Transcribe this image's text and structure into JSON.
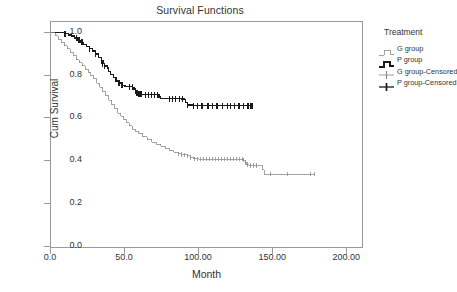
{
  "chart_data": {
    "type": "line",
    "title": "Survival Functions",
    "xlabel": "Month",
    "ylabel": "Cum Survival",
    "xlim": [
      0,
      210
    ],
    "ylim": [
      0.0,
      1.05
    ],
    "xticks": [
      "0.0",
      "50.0",
      "100.00",
      "150.00",
      "200.00"
    ],
    "xtick_values": [
      0,
      50,
      100,
      150,
      200
    ],
    "yticks": [
      "0.0",
      "0.2",
      "0.4",
      "0.6",
      "0.8",
      "1.0"
    ],
    "ytick_values": [
      0.0,
      0.2,
      0.4,
      0.6,
      0.8,
      1.0
    ],
    "grid": false,
    "legend_position": "right",
    "legend_title": "Treatment",
    "series": [
      {
        "name": "P group",
        "color": "#1a1a1a",
        "width": 1.4,
        "style": "step",
        "points": [
          [
            0,
            1.0
          ],
          [
            9,
            1.0
          ],
          [
            9,
            0.995
          ],
          [
            12,
            0.99
          ],
          [
            14,
            0.985
          ],
          [
            16,
            0.975
          ],
          [
            18,
            0.965
          ],
          [
            20,
            0.955
          ],
          [
            22,
            0.945
          ],
          [
            24,
            0.935
          ],
          [
            26,
            0.925
          ],
          [
            28,
            0.915
          ],
          [
            30,
            0.9
          ],
          [
            32,
            0.885
          ],
          [
            34,
            0.87
          ],
          [
            35,
            0.855
          ],
          [
            36,
            0.845
          ],
          [
            38,
            0.835
          ],
          [
            39,
            0.82
          ],
          [
            40,
            0.805
          ],
          [
            42,
            0.79
          ],
          [
            44,
            0.775
          ],
          [
            46,
            0.765
          ],
          [
            48,
            0.755
          ],
          [
            50,
            0.75
          ],
          [
            53,
            0.748
          ],
          [
            55,
            0.745
          ],
          [
            56,
            0.735
          ],
          [
            57,
            0.73
          ],
          [
            58,
            0.72
          ],
          [
            59,
            0.715
          ],
          [
            60,
            0.712
          ],
          [
            62,
            0.711
          ],
          [
            65,
            0.711
          ],
          [
            68,
            0.711
          ],
          [
            70,
            0.711
          ],
          [
            72,
            0.711
          ],
          [
            73,
            0.7
          ],
          [
            74,
            0.692
          ],
          [
            78,
            0.692
          ],
          [
            82,
            0.692
          ],
          [
            86,
            0.692
          ],
          [
            88,
            0.69
          ],
          [
            90,
            0.688
          ],
          [
            91,
            0.675
          ],
          [
            92,
            0.662
          ],
          [
            96,
            0.66
          ],
          [
            100,
            0.66
          ],
          [
            106,
            0.66
          ],
          [
            110,
            0.66
          ],
          [
            116,
            0.66
          ],
          [
            120,
            0.66
          ],
          [
            124,
            0.66
          ],
          [
            128,
            0.66
          ],
          [
            132,
            0.66
          ],
          [
            136,
            0.66
          ]
        ],
        "censored": [
          9,
          10,
          17,
          19,
          21,
          26,
          30,
          34,
          35,
          36,
          46,
          48,
          53,
          55,
          57,
          58,
          59,
          60,
          61,
          64,
          66,
          68,
          70,
          72,
          80,
          82,
          84,
          87,
          89,
          92,
          96,
          99,
          102,
          106,
          109,
          112,
          116,
          119,
          121,
          124,
          127,
          130,
          133,
          135,
          136
        ]
      },
      {
        "name": "G group",
        "color": "#8c8c8c",
        "width": 0.8,
        "style": "step",
        "points": [
          [
            0,
            1.0
          ],
          [
            3,
            0.985
          ],
          [
            5,
            0.97
          ],
          [
            7,
            0.955
          ],
          [
            9,
            0.94
          ],
          [
            11,
            0.925
          ],
          [
            13,
            0.91
          ],
          [
            15,
            0.895
          ],
          [
            17,
            0.875
          ],
          [
            19,
            0.86
          ],
          [
            21,
            0.845
          ],
          [
            23,
            0.83
          ],
          [
            25,
            0.815
          ],
          [
            27,
            0.8
          ],
          [
            29,
            0.785
          ],
          [
            31,
            0.765
          ],
          [
            33,
            0.745
          ],
          [
            35,
            0.725
          ],
          [
            37,
            0.705
          ],
          [
            39,
            0.685
          ],
          [
            41,
            0.665
          ],
          [
            43,
            0.645
          ],
          [
            45,
            0.625
          ],
          [
            47,
            0.61
          ],
          [
            49,
            0.595
          ],
          [
            51,
            0.58
          ],
          [
            53,
            0.565
          ],
          [
            55,
            0.55
          ],
          [
            57,
            0.54
          ],
          [
            59,
            0.53
          ],
          [
            62,
            0.515
          ],
          [
            65,
            0.5
          ],
          [
            68,
            0.49
          ],
          [
            71,
            0.48
          ],
          [
            74,
            0.47
          ],
          [
            77,
            0.46
          ],
          [
            80,
            0.45
          ],
          [
            83,
            0.443
          ],
          [
            86,
            0.435
          ],
          [
            88,
            0.432
          ],
          [
            90,
            0.43
          ],
          [
            92,
            0.425
          ],
          [
            94,
            0.418
          ],
          [
            96,
            0.412
          ],
          [
            100,
            0.41
          ],
          [
            106,
            0.41
          ],
          [
            112,
            0.41
          ],
          [
            118,
            0.41
          ],
          [
            124,
            0.41
          ],
          [
            128,
            0.41
          ],
          [
            130,
            0.405
          ],
          [
            131,
            0.395
          ],
          [
            132,
            0.385
          ],
          [
            134,
            0.38
          ],
          [
            138,
            0.38
          ],
          [
            142,
            0.38
          ],
          [
            143,
            0.36
          ],
          [
            144,
            0.34
          ],
          [
            150,
            0.34
          ],
          [
            160,
            0.34
          ],
          [
            170,
            0.34
          ],
          [
            178,
            0.34
          ]
        ],
        "censored": [
          86,
          88,
          90,
          92,
          94,
          97,
          99,
          101,
          103,
          105,
          107,
          109,
          111,
          113,
          115,
          117,
          119,
          121,
          123,
          125,
          127,
          129,
          130,
          131,
          133,
          135,
          137,
          139,
          148,
          160,
          175,
          178
        ]
      }
    ],
    "legend_entries": [
      {
        "label": "G group",
        "key": "step-gray",
        "color": "#8c8c8c"
      },
      {
        "label": "P group",
        "key": "step-black",
        "color": "#1a1a1a"
      },
      {
        "label": "G group-Censored",
        "key": "cross-gray",
        "color": "#8c8c8c"
      },
      {
        "label": "P group-Censored",
        "key": "cross-black",
        "color": "#1a1a1a"
      }
    ]
  },
  "colors": {
    "axis": "#9a9a9a",
    "text": "#333333",
    "background": "#ffffff"
  }
}
